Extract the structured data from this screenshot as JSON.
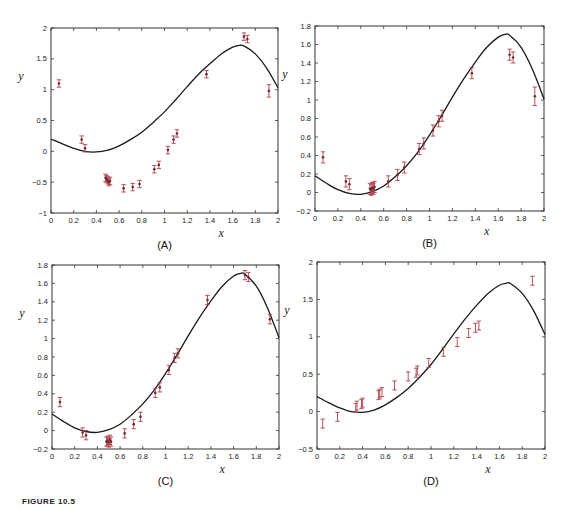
{
  "figure": {
    "caption": "FIGURE 10.5",
    "curve_color": "#1a1a1a",
    "point_color": "#b0404a"
  },
  "chart_data": [
    {
      "type": "scatter",
      "panel": "(A)",
      "title": "",
      "xlabel": "x",
      "ylabel": "y",
      "xlim": [
        0,
        2
      ],
      "ylim": [
        -1,
        2
      ],
      "xticks": [
        "0",
        "0.2",
        "0.4",
        "0.6",
        "0.8",
        "1",
        "1.2",
        "1.4",
        "1.6",
        "1.8",
        "2"
      ],
      "yticks": [
        "-1",
        "-0.5",
        "0",
        "0.5",
        "1",
        "1.5",
        "2"
      ],
      "grid": false,
      "frame": {
        "left": 51,
        "top": 28,
        "right": 278,
        "bottom": 213
      },
      "series": [
        {
          "name": "model curve",
          "kind": "line",
          "x": [
            0,
            0.1,
            0.2,
            0.3,
            0.4,
            0.5,
            0.6,
            0.7,
            0.8,
            0.9,
            1.0,
            1.1,
            1.2,
            1.3,
            1.4,
            1.5,
            1.6,
            1.66,
            1.7,
            1.8,
            1.9,
            2.0
          ],
          "y": [
            0.2,
            0.12,
            0.05,
            0.0,
            -0.01,
            0.02,
            0.09,
            0.19,
            0.31,
            0.47,
            0.64,
            0.84,
            1.05,
            1.25,
            1.42,
            1.58,
            1.69,
            1.72,
            1.71,
            1.58,
            1.35,
            1.03
          ]
        },
        {
          "name": "data",
          "kind": "errorbar",
          "x": [
            0.07,
            0.27,
            0.3,
            0.48,
            0.49,
            0.5,
            0.51,
            0.52,
            0.64,
            0.72,
            0.78,
            0.91,
            0.95,
            1.03,
            1.08,
            1.11,
            1.37,
            1.7,
            1.73,
            1.92
          ],
          "y": [
            1.1,
            0.19,
            0.05,
            -0.43,
            -0.45,
            -0.47,
            -0.5,
            -0.48,
            -0.6,
            -0.58,
            -0.53,
            -0.29,
            -0.22,
            0.02,
            0.19,
            0.29,
            1.25,
            1.86,
            1.82,
            0.98
          ],
          "err": [
            0.06,
            0.06,
            0.06,
            0.06,
            0.06,
            0.06,
            0.06,
            0.06,
            0.06,
            0.06,
            0.06,
            0.06,
            0.06,
            0.06,
            0.06,
            0.06,
            0.06,
            0.06,
            0.06,
            0.1
          ]
        }
      ]
    },
    {
      "type": "scatter",
      "panel": "(B)",
      "title": "",
      "xlabel": "x",
      "ylabel": "y",
      "xlim": [
        0,
        2
      ],
      "ylim": [
        -0.2,
        1.8
      ],
      "xticks": [
        "0",
        "0.2",
        "0.4",
        "0.6",
        "0.8",
        "1",
        "1.2",
        "1.4",
        "1.6",
        "1.8",
        "2"
      ],
      "yticks": [
        "-0.2",
        "0",
        "0.2",
        "0.4",
        "0.6",
        "0.8",
        "1",
        "1.2",
        "1.4",
        "1.6",
        "1.8"
      ],
      "grid": false,
      "frame": {
        "left": 315,
        "top": 26,
        "right": 544,
        "bottom": 211
      },
      "series": [
        {
          "name": "model curve",
          "kind": "line",
          "x": [
            0,
            0.1,
            0.2,
            0.3,
            0.4,
            0.5,
            0.6,
            0.7,
            0.8,
            0.9,
            1.0,
            1.1,
            1.2,
            1.3,
            1.4,
            1.5,
            1.6,
            1.66,
            1.7,
            1.8,
            1.9,
            2.0
          ],
          "y": [
            0.18,
            0.1,
            0.03,
            -0.01,
            -0.02,
            0.01,
            0.07,
            0.17,
            0.29,
            0.44,
            0.62,
            0.82,
            1.03,
            1.23,
            1.41,
            1.57,
            1.68,
            1.71,
            1.7,
            1.57,
            1.33,
            1.01
          ]
        },
        {
          "name": "data",
          "kind": "errorbar",
          "x": [
            0.07,
            0.27,
            0.3,
            0.48,
            0.49,
            0.5,
            0.51,
            0.52,
            0.64,
            0.72,
            0.78,
            0.91,
            0.95,
            1.03,
            1.08,
            1.11,
            1.37,
            1.7,
            1.73,
            1.92
          ],
          "y": [
            0.38,
            0.12,
            0.09,
            0.04,
            0.03,
            0.05,
            0.04,
            0.06,
            0.12,
            0.19,
            0.27,
            0.47,
            0.53,
            0.67,
            0.77,
            0.83,
            1.29,
            1.49,
            1.46,
            1.04
          ],
          "err": [
            0.06,
            0.06,
            0.06,
            0.06,
            0.06,
            0.06,
            0.06,
            0.06,
            0.06,
            0.06,
            0.06,
            0.06,
            0.06,
            0.06,
            0.06,
            0.06,
            0.06,
            0.06,
            0.06,
            0.1
          ]
        }
      ]
    },
    {
      "type": "scatter",
      "panel": "(C)",
      "title": "",
      "xlabel": "x",
      "ylabel": "y",
      "xlim": [
        0,
        2
      ],
      "ylim": [
        -0.2,
        1.8
      ],
      "xticks": [
        "0",
        "0.2",
        "0.4",
        "0.6",
        "0.8",
        "1",
        "1.2",
        "1.4",
        "1.6",
        "1.8",
        "2"
      ],
      "yticks": [
        "-0.2",
        "0",
        "0.2",
        "0.4",
        "0.6",
        "0.8",
        "1",
        "1.2",
        "1.4",
        "1.6",
        "1.8"
      ],
      "grid": false,
      "frame": {
        "left": 52,
        "top": 265,
        "right": 279,
        "bottom": 449
      },
      "series": [
        {
          "name": "model curve",
          "kind": "line",
          "x": [
            0,
            0.1,
            0.2,
            0.3,
            0.4,
            0.5,
            0.6,
            0.7,
            0.8,
            0.9,
            1.0,
            1.1,
            1.2,
            1.3,
            1.4,
            1.5,
            1.6,
            1.66,
            1.7,
            1.8,
            1.9,
            2.0
          ],
          "y": [
            0.18,
            0.1,
            0.03,
            -0.01,
            -0.02,
            0.01,
            0.07,
            0.17,
            0.29,
            0.44,
            0.62,
            0.82,
            1.03,
            1.23,
            1.41,
            1.57,
            1.68,
            1.71,
            1.7,
            1.57,
            1.33,
            1.01
          ]
        },
        {
          "name": "data",
          "kind": "errorbar",
          "x": [
            0.07,
            0.27,
            0.3,
            0.48,
            0.49,
            0.5,
            0.51,
            0.52,
            0.64,
            0.72,
            0.78,
            0.91,
            0.95,
            1.03,
            1.08,
            1.11,
            1.37,
            1.7,
            1.73,
            1.92
          ],
          "y": [
            0.31,
            -0.02,
            -0.05,
            -0.12,
            -0.11,
            -0.13,
            -0.1,
            -0.12,
            -0.03,
            0.07,
            0.15,
            0.41,
            0.47,
            0.66,
            0.79,
            0.84,
            1.42,
            1.69,
            1.67,
            1.21
          ],
          "err": [
            0.05,
            0.05,
            0.05,
            0.05,
            0.05,
            0.05,
            0.05,
            0.05,
            0.05,
            0.05,
            0.05,
            0.05,
            0.05,
            0.05,
            0.05,
            0.05,
            0.05,
            0.05,
            0.05,
            0.05
          ]
        }
      ]
    },
    {
      "type": "scatter",
      "panel": "(D)",
      "title": "",
      "xlabel": "x",
      "ylabel": "y",
      "xlim": [
        0,
        2
      ],
      "ylim": [
        -0.5,
        2
      ],
      "xticks": [
        "0",
        "0.2",
        "0.4",
        "0.6",
        "0.8",
        "1",
        "1.2",
        "1.4",
        "1.6",
        "1.8",
        "2"
      ],
      "yticks": [
        "-0.5",
        "0",
        "0.5",
        "1",
        "1.5",
        "2"
      ],
      "grid": false,
      "frame": {
        "left": 317,
        "top": 262,
        "right": 545,
        "bottom": 449
      },
      "series": [
        {
          "name": "model curve",
          "kind": "line",
          "x": [
            0,
            0.1,
            0.2,
            0.3,
            0.4,
            0.5,
            0.6,
            0.7,
            0.8,
            0.9,
            1.0,
            1.1,
            1.2,
            1.3,
            1.4,
            1.5,
            1.6,
            1.67,
            1.7,
            1.8,
            1.9,
            2.0
          ],
          "y": [
            0.2,
            0.12,
            0.05,
            0.0,
            -0.01,
            0.02,
            0.09,
            0.19,
            0.31,
            0.46,
            0.63,
            0.83,
            1.04,
            1.24,
            1.42,
            1.58,
            1.69,
            1.72,
            1.71,
            1.58,
            1.35,
            1.03
          ]
        },
        {
          "name": "data",
          "kind": "errorbar",
          "x": [
            0.05,
            0.18,
            0.34,
            0.35,
            0.39,
            0.4,
            0.54,
            0.55,
            0.57,
            0.68,
            0.8,
            0.87,
            0.88,
            0.98,
            1.11,
            1.23,
            1.33,
            1.39,
            1.42,
            1.89
          ],
          "y": [
            -0.16,
            -0.07,
            0.05,
            0.08,
            0.1,
            0.12,
            0.22,
            0.24,
            0.26,
            0.35,
            0.47,
            0.52,
            0.55,
            0.65,
            0.8,
            0.93,
            1.05,
            1.12,
            1.15,
            1.75
          ],
          "err": [
            0.06,
            0.06,
            0.06,
            0.06,
            0.06,
            0.06,
            0.06,
            0.06,
            0.06,
            0.06,
            0.06,
            0.06,
            0.06,
            0.06,
            0.06,
            0.06,
            0.06,
            0.06,
            0.06,
            0.06
          ]
        }
      ]
    }
  ]
}
